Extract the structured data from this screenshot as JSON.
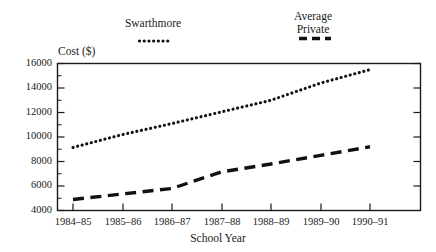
{
  "chart_data": {
    "type": "line",
    "title": "",
    "xlabel": "School Year",
    "ylabel": "Cost ($)",
    "categories": [
      "1984–85",
      "1985–86",
      "1986–87",
      "1987–88",
      "1988–89",
      "1989–90",
      "1990–91"
    ],
    "ylim": [
      4000,
      16000
    ],
    "ytick_labels": [
      "4000",
      "6000",
      "8000",
      "10000",
      "12000",
      "14000",
      "16000"
    ],
    "ytick_values": [
      4000,
      6000,
      8000,
      10000,
      12000,
      14000,
      16000
    ],
    "yminor_values": [
      5000,
      7000,
      9000,
      11000,
      13000,
      15000
    ],
    "grid": false,
    "legend_position": "above-plot",
    "series": [
      {
        "name": "Swarthmore",
        "legend_line_1": "Swarthmore",
        "legend_line_2": "",
        "style": "dotted",
        "values": [
          9150,
          10200,
          11100,
          12050,
          13000,
          14400,
          15500
        ]
      },
      {
        "name": "Average Private",
        "legend_line_1": "Average",
        "legend_line_2": "Private",
        "style": "dashed",
        "values": [
          4900,
          5350,
          5800,
          7150,
          7800,
          8500,
          9200
        ]
      }
    ]
  },
  "colors": {
    "series": "#111111",
    "axis": "#1a1a1a",
    "background": "#ffffff"
  }
}
